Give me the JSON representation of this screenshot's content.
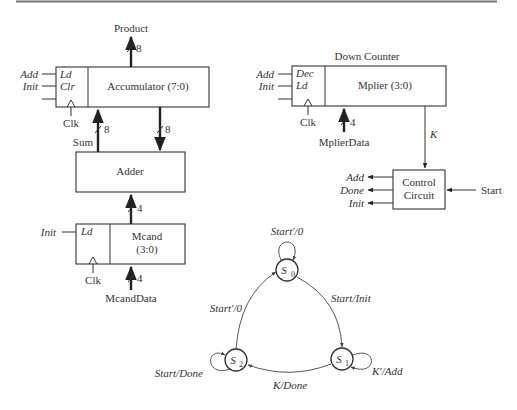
{
  "figure": {
    "datapath": {
      "accumulator": {
        "title": "Accumulator (7:0)",
        "ctrl_labels": [
          "Ld",
          "Clr"
        ],
        "inputs": [
          "Add",
          "Init"
        ],
        "clock": "Clk",
        "output_label": "Product",
        "output_width": "8",
        "sum_label": "Sum",
        "sum_width": "8",
        "to_adder_width": "8"
      },
      "adder": {
        "title": "Adder",
        "input_width": "4"
      },
      "mcand": {
        "title_line1": "Mcand",
        "title_line2": "(3:0)",
        "ctrl_labels": [
          "Ld"
        ],
        "inputs": [
          "Init"
        ],
        "clock": "Clk",
        "data_label": "McandData",
        "data_width": "4"
      },
      "mplier": {
        "heading": "Down Counter",
        "title": "Mplier (3:0)",
        "ctrl_labels": [
          "Dec",
          "Ld"
        ],
        "inputs": [
          "Add",
          "Init"
        ],
        "clock": "Clk",
        "data_label": "MplierData",
        "data_width": "4",
        "k_label": "K"
      },
      "control": {
        "title_line1": "Control",
        "title_line2": "Circuit",
        "outputs": [
          "Add",
          "Done",
          "Init"
        ],
        "input": "Start"
      }
    },
    "state_graph": {
      "states": [
        {
          "name": "S",
          "sub": "0"
        },
        {
          "name": "S",
          "sub": "1"
        },
        {
          "name": "S",
          "sub": "2"
        }
      ],
      "transitions": {
        "s0_self": "Start′/0",
        "s0_to_s1": "Start/Init",
        "s1_self": "K′/Add",
        "s1_to_s2": "K/Done",
        "s2_self": "Start/Done",
        "s2_to_s0": "Start′/0"
      }
    },
    "colors": {
      "line": "#333333",
      "background": "#ffffff"
    }
  }
}
